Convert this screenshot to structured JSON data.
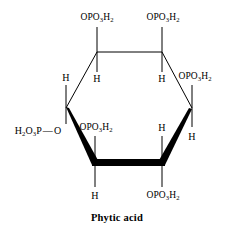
{
  "figure": {
    "caption": "Phytic acid",
    "molecule_name": "Phytic acid",
    "projection": "Haworth",
    "ring": "cyclohexane",
    "colors": {
      "stroke": "#000000",
      "background": "#ffffff",
      "text": "#000000"
    }
  },
  "labels": {
    "top_left_substituent": "OPO₃H₂",
    "top_right_substituent": "OPO₃H₂",
    "right_substituent": "OPO₃H₂",
    "left_chain": "H₂O₃P—O",
    "inner_left_lower_substituent": "OPO₃H₂",
    "bottom_right_substituent": "OPO₃H₂",
    "upper_left_outer_h": "H",
    "upper_left_inner_h": "H",
    "upper_right_inner_h": "H",
    "lower_right_inner_h": "H",
    "lower_right_outer_h": "H",
    "bottom_left_h": "H"
  },
  "label_parts": {
    "opo3h2": {
      "a": "OPO",
      "sub1": "3",
      "b": "H",
      "sub2": "2"
    },
    "left_chain": {
      "a": "H",
      "sub1": "2",
      "b": "O",
      "sub2": "3",
      "c": "P",
      "bond": "—",
      "d": "O"
    }
  },
  "geometry": {
    "ring_vertices": [
      {
        "name": "top-left",
        "x": 97,
        "y": 52
      },
      {
        "name": "top-right",
        "x": 162,
        "y": 52
      },
      {
        "name": "right",
        "x": 192,
        "y": 108
      },
      {
        "name": "bottom-right",
        "x": 162,
        "y": 163
      },
      {
        "name": "bottom-left",
        "x": 95,
        "y": 163
      },
      {
        "name": "left",
        "x": 66,
        "y": 108
      }
    ],
    "bold_front_bonds": [
      "left-to-bottom-left",
      "bottom-left-to-bottom-right",
      "bottom-right-to-right"
    ],
    "thin_back_bonds": [
      "left-to-top-left",
      "top-left-to-top-right",
      "top-right-to-right"
    ]
  }
}
